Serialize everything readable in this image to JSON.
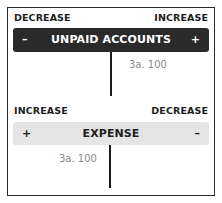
{
  "accounts": [
    {
      "name": "UNPAID ACCOUNTS",
      "left_label": "DECREASE",
      "right_label": "INCREASE",
      "left_sign": "–",
      "right_sign": "+",
      "style": "dark",
      "entries": {
        "left": [],
        "right": [
          "3a. 100"
        ]
      }
    },
    {
      "name": "EXPENSE",
      "left_label": "INCREASE",
      "right_label": "DECREASE",
      "left_sign": "+",
      "right_sign": "–",
      "style": "light",
      "entries": {
        "left": [
          "3a. 100"
        ],
        "right": []
      }
    }
  ],
  "colors": {
    "dark_header": "#2a2a2a",
    "light_header": "#e5e5e5",
    "entry_text": "#8a8a8a"
  }
}
